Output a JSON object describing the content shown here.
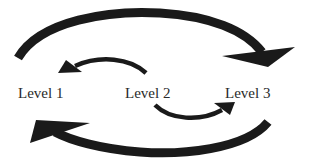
{
  "diagram": {
    "type": "cycle-flow",
    "nodes": [
      {
        "id": "level1",
        "label": "Level 1"
      },
      {
        "id": "level2",
        "label": "Level 2"
      },
      {
        "id": "level3",
        "label": "Level 3"
      }
    ],
    "edges": [
      {
        "from": "level1",
        "to": "level3",
        "style": "large-curved-arrow",
        "position": "top"
      },
      {
        "from": "level2",
        "to": "level1",
        "style": "small-curved-arrow",
        "position": "upper-middle"
      },
      {
        "from": "level2",
        "to": "level3",
        "style": "small-curved-arrow",
        "position": "lower-middle"
      },
      {
        "from": "level3",
        "to": "level1",
        "style": "large-curved-arrow",
        "position": "bottom"
      }
    ],
    "colors": {
      "arrow": "#1a1a1a",
      "text": "#2a2a2a",
      "background": "#ffffff"
    }
  }
}
